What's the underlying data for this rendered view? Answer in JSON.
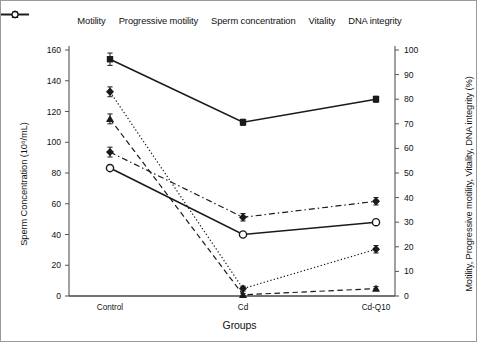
{
  "chart_data": {
    "type": "line",
    "title": "",
    "xlabel": "Groups",
    "ylabel": "Sperm Concentration (10⁶/mL)",
    "y2label": "Motility, Progressive motility, Vitality, DNA integrity (%)",
    "categories": [
      "Control",
      "Cd",
      "Cd-Q10"
    ],
    "ylim": [
      0,
      160
    ],
    "yticks": [
      0,
      20,
      40,
      60,
      80,
      100,
      120,
      140,
      160
    ],
    "y2lim": [
      0,
      100
    ],
    "y2ticks": [
      0,
      10,
      20,
      30,
      40,
      50,
      60,
      70,
      80,
      90,
      100
    ],
    "grid": false,
    "legend_position": "top",
    "series": [
      {
        "name": "Motility",
        "axis": "right",
        "unit": "%",
        "marker": "filled-diamond",
        "line": "dotted",
        "values": [
          83,
          3,
          19
        ],
        "errors": [
          2,
          1,
          1.5
        ]
      },
      {
        "name": "Progressive motility",
        "axis": "right",
        "unit": "%",
        "marker": "filled-triangle",
        "line": "dashed",
        "values": [
          72,
          0.5,
          3
        ],
        "errors": [
          2,
          0.5,
          0.8
        ]
      },
      {
        "name": "Sperm concentration",
        "axis": "left",
        "unit": "10⁶/mL",
        "marker": "filled-square",
        "line": "solid",
        "values": [
          154,
          113,
          128
        ],
        "errors": [
          4,
          2,
          2
        ]
      },
      {
        "name": "Vitality",
        "axis": "right",
        "unit": "%",
        "marker": "filled-diamond",
        "line": "dash-dot",
        "values": [
          58.5,
          32,
          38.5
        ],
        "errors": [
          2,
          1.5,
          1.5
        ]
      },
      {
        "name": "DNA integrity",
        "axis": "right",
        "unit": "%",
        "marker": "open-circle",
        "line": "solid",
        "values": [
          52,
          25,
          30
        ],
        "errors": [
          0,
          0,
          0
        ]
      }
    ]
  },
  "legend": {
    "items": [
      {
        "label": "Motility"
      },
      {
        "label": "Progressive motility"
      },
      {
        "label": "Sperm concentration"
      },
      {
        "label": "Vitality"
      },
      {
        "label": "DNA integrity"
      }
    ]
  },
  "axes": {
    "x_title": "Groups",
    "y_left_title": "Sperm Concentration (10⁶/mL)",
    "y_right_title": "Motility, Progressive motility, Vitality, DNA integrity (%)",
    "x_categories": [
      "Control",
      "Cd",
      "Cd-Q10"
    ],
    "y_left_ticks": [
      "0",
      "20",
      "40",
      "60",
      "80",
      "100",
      "120",
      "140",
      "160"
    ],
    "y_right_ticks": [
      "0",
      "10",
      "20",
      "30",
      "40",
      "50",
      "60",
      "70",
      "80",
      "90",
      "100"
    ]
  },
  "colors": {
    "line": "#1a1a1a",
    "axis": "#555555",
    "background": "#ffffff",
    "frame": "#9a9a9a"
  }
}
